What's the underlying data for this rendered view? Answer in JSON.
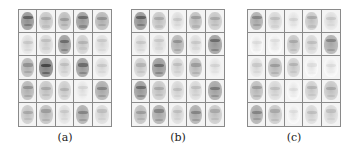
{
  "figure": {
    "panels": [
      {
        "id": "a",
        "label": "(a)",
        "left": 18,
        "rows": 5,
        "cols": 5,
        "tiles": [
          0.75,
          0.45,
          0.5,
          0.7,
          0.55,
          0.3,
          0.35,
          0.7,
          0.4,
          0.3,
          0.55,
          0.85,
          0.35,
          0.7,
          0.3,
          0.55,
          0.45,
          0.4,
          0.25,
          0.6,
          0.45,
          0.5,
          0.3,
          0.6,
          0.35
        ]
      },
      {
        "id": "b",
        "label": "(b)",
        "left": 131,
        "rows": 5,
        "cols": 5,
        "tiles": [
          0.75,
          0.45,
          0.3,
          0.5,
          0.45,
          0.3,
          0.3,
          0.55,
          0.3,
          0.7,
          0.4,
          0.7,
          0.35,
          0.5,
          0.25,
          0.7,
          0.45,
          0.35,
          0.35,
          0.65,
          0.5,
          0.6,
          0.35,
          0.6,
          0.45
        ]
      },
      {
        "id": "c",
        "label": "(c)",
        "left": 247,
        "rows": 5,
        "cols": 5,
        "tiles": [
          0.6,
          0.35,
          0.25,
          0.45,
          0.3,
          0.2,
          0.2,
          0.45,
          0.35,
          0.6,
          0.3,
          0.5,
          0.4,
          0.2,
          0.2,
          0.5,
          0.35,
          0.2,
          0.4,
          0.45,
          0.6,
          0.45,
          0.2,
          0.35,
          0.35
        ]
      }
    ]
  }
}
